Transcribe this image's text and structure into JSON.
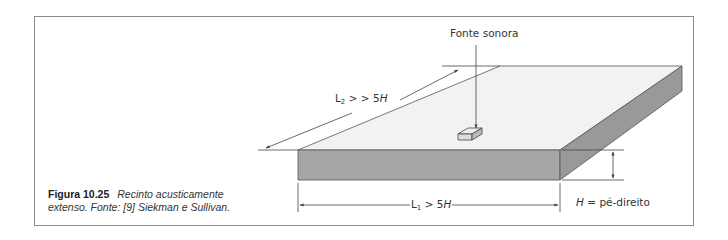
{
  "figure": {
    "number": "Figura 10.25",
    "caption": "Recinto acusticamente extenso. Fonte: [9] Siekman e Sullivan.",
    "caption_line1": "Recinto acusticamente",
    "caption_line2": "extenso. Fonte: [9] Siekman e Sullivan."
  },
  "labels": {
    "source": "Fonte sonora",
    "l2_prefix": "L",
    "l2_sub": "2",
    "l2_relation": " > > 5",
    "l2_var": "H",
    "l1_prefix": "L",
    "l1_sub": "1",
    "l1_relation": " > 5",
    "l1_var": "H",
    "h_var": "H",
    "h_def": " = pé-direito"
  },
  "colors": {
    "top_face": "#f2f2f2",
    "front_face": "#a6a6a6",
    "side_face": "#999999",
    "line": "#444444",
    "frame": "#8a8a8a"
  }
}
